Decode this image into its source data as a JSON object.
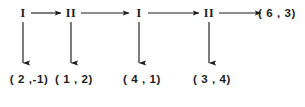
{
  "figure": {
    "background": "#ffffff",
    "ink_color": "#1d1d1d",
    "nodes": [
      {
        "label": "I",
        "x": 23,
        "y": 13
      },
      {
        "label": "II",
        "x": 71,
        "y": 13
      },
      {
        "label": "I",
        "x": 139,
        "y": 13
      },
      {
        "label": "II",
        "x": 209,
        "y": 13
      }
    ],
    "outputs": [
      {
        "label": "( 2 ,-1)",
        "x": 23,
        "y": 80
      },
      {
        "label": "( 1 , 2)",
        "x": 71,
        "y": 80
      },
      {
        "label": "( 4 , 1)",
        "x": 139,
        "y": 80
      },
      {
        "label": "( 3 , 4)",
        "x": 209,
        "y": 80
      }
    ],
    "final_output": {
      "label": "( 6 , 3)",
      "x": 267,
      "y": 14
    },
    "horizontal_arrows": [
      {
        "from_x": 31,
        "to_x": 63,
        "y": 13
      },
      {
        "from_x": 80,
        "to_x": 131,
        "y": 13
      },
      {
        "from_x": 147,
        "to_x": 201,
        "y": 13
      },
      {
        "from_x": 218,
        "to_x": 263,
        "y": 13
      }
    ],
    "vertical_arrows": [
      {
        "x": 23,
        "from_y": 22,
        "to_y": 67
      },
      {
        "x": 71,
        "from_y": 22,
        "to_y": 67
      },
      {
        "x": 139,
        "from_y": 22,
        "to_y": 67
      },
      {
        "x": 209,
        "from_y": 22,
        "to_y": 67
      }
    ]
  }
}
